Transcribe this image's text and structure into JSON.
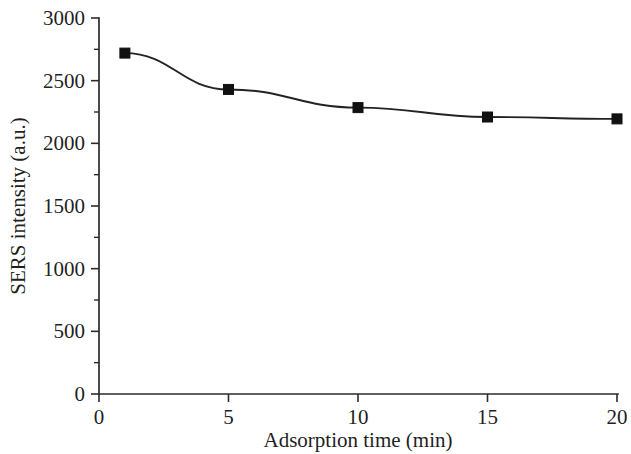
{
  "chart_data": {
    "type": "line",
    "title": "",
    "subtitle": "",
    "xlabel": "Adsorption time (min)",
    "ylabel": "SERS intensity (a.u.)",
    "xlim": [
      0,
      20
    ],
    "ylim": [
      0,
      3000
    ],
    "grid": false,
    "legend": null,
    "legend_position": "none",
    "marker": "filled-square",
    "line_color": "#232323",
    "marker_color": "#111111",
    "x": [
      1,
      5,
      10,
      15,
      20
    ],
    "values": [
      2720,
      2430,
      2285,
      2210,
      2195
    ],
    "points": [
      {
        "x": 1,
        "y": 2720
      },
      {
        "x": 5,
        "y": 2430
      },
      {
        "x": 10,
        "y": 2285
      },
      {
        "x": 15,
        "y": 2210
      },
      {
        "x": 20,
        "y": 2195
      }
    ],
    "xticks": [
      0,
      5,
      10,
      15,
      20
    ],
    "xtick_labels": [
      "0",
      "5",
      "10",
      "15",
      "20"
    ],
    "yticks": [
      0,
      500,
      1000,
      1500,
      2000,
      2500,
      3000
    ],
    "ytick_labels": [
      "0",
      "500",
      "1000",
      "1500",
      "2000",
      "2500",
      "3000"
    ],
    "y_minor_ticks": [
      250,
      750,
      1250,
      1750,
      2250,
      2750
    ],
    "x_minor_ticks": [],
    "annotations": []
  }
}
